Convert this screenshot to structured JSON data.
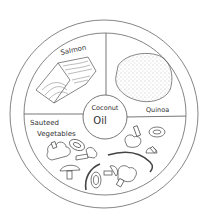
{
  "diagram": {
    "type": "plate-portion-diagram",
    "colors": {
      "line": "#555555",
      "text": "#333333",
      "background": "#ffffff"
    },
    "sections": [
      {
        "id": "salmon",
        "label": "Salmon",
        "position": "upper-left",
        "icon": "salmon-fillet-icon"
      },
      {
        "id": "quinoa",
        "label": "Quinoa",
        "position": "upper-right",
        "icon": "quinoa-pile-icon"
      },
      {
        "id": "vegetables",
        "label_line1": "Sauteed",
        "label_line2": "Vegetables",
        "position": "bottom-half",
        "icon": "vegetables-icon"
      }
    ],
    "center": {
      "label_line1": "Coconut",
      "label_line2": "Oil"
    }
  }
}
